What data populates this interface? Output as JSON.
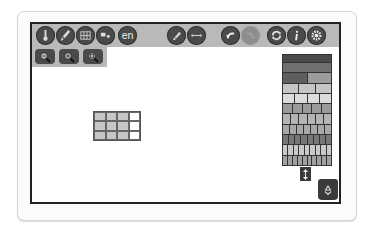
{
  "toolbar": {
    "buttons": [
      {
        "name": "thermometer",
        "left": 4
      },
      {
        "name": "paint-brush",
        "left": 24
      },
      {
        "name": "grid-table",
        "left": 44
      },
      {
        "name": "paint-bucket",
        "left": 64
      },
      {
        "name": "language",
        "label": "en",
        "left": 86
      },
      {
        "name": "pencil-erase",
        "left": 135
      },
      {
        "name": "resize-arrows",
        "left": 155
      },
      {
        "name": "undo",
        "left": 189
      },
      {
        "name": "redo",
        "left": 209,
        "disabled": true
      },
      {
        "name": "refresh",
        "left": 235
      },
      {
        "name": "info",
        "left": 255
      },
      {
        "name": "settings-gear",
        "left": 275
      }
    ],
    "language_label": "en"
  },
  "zoom_controls": [
    {
      "name": "zoom-out"
    },
    {
      "name": "zoom-in"
    },
    {
      "name": "zoom-reset"
    }
  ],
  "grid": {
    "rows": 3,
    "cols": 4,
    "filled_cols": 3
  },
  "palette": {
    "rows": [
      {
        "parts": 1,
        "color": "#4b4b4b"
      },
      {
        "parts": 1,
        "color": "#707070"
      },
      {
        "parts": 2,
        "color": [
          "#5e5e5e",
          "#9c9c9c"
        ]
      },
      {
        "parts": 3,
        "color": "#c5c5c5"
      },
      {
        "parts": 4,
        "color": "#dcdcdc"
      },
      {
        "parts": 5,
        "color": "#9a9a9a"
      },
      {
        "parts": 6,
        "color": "#b4b4b4"
      },
      {
        "parts": 7,
        "color": "#a8a8a8"
      },
      {
        "parts": 8,
        "color": "#777777"
      },
      {
        "parts": 9,
        "color": "#c9c9c9"
      },
      {
        "parts": 10,
        "color": "#a0a0a0"
      }
    ]
  },
  "colors": {
    "toolbar_bg": "#b9b9b9",
    "button_bg": "#4a4a4a",
    "canvas_border": "#222222"
  }
}
